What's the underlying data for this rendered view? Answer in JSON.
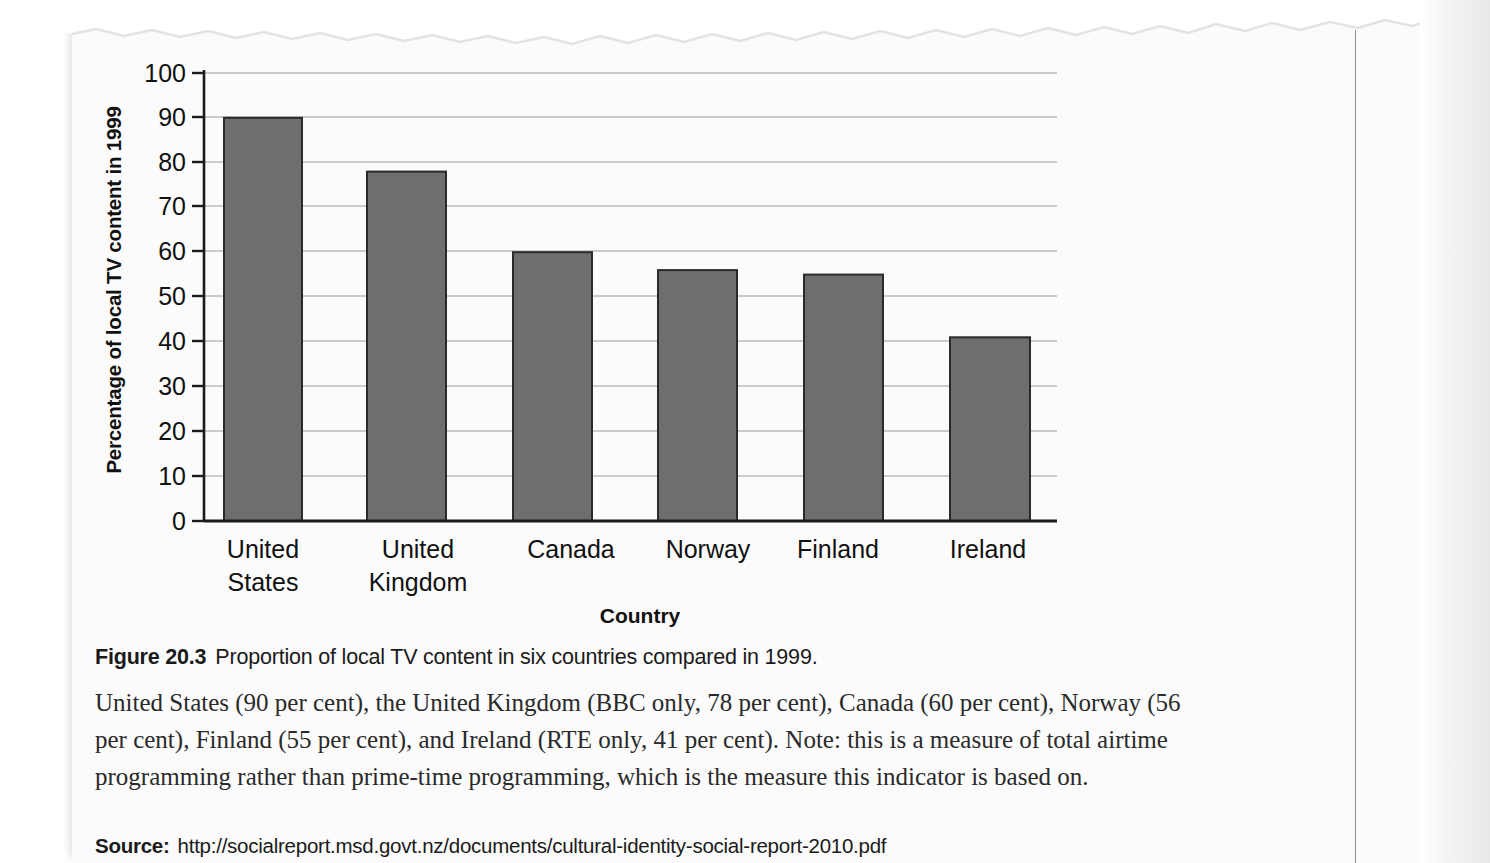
{
  "chart_data": {
    "type": "bar",
    "title": "",
    "xlabel": "Country",
    "ylabel": "Percentage of local TV content in 1999",
    "categories": [
      "United States",
      "United Kingdom",
      "Canada",
      "Norway",
      "Finland",
      "Ireland"
    ],
    "category_lines": [
      [
        "United",
        "States"
      ],
      [
        "United",
        "Kingdom"
      ],
      [
        "Canada"
      ],
      [
        "Norway"
      ],
      [
        "Finland"
      ],
      [
        "Ireland"
      ]
    ],
    "values": [
      90,
      78,
      60,
      56,
      55,
      41
    ],
    "ylim": [
      0,
      100
    ],
    "ytick_labels": [
      "0",
      "10",
      "20",
      "30",
      "40",
      "50",
      "60",
      "70",
      "80",
      "90",
      "100"
    ],
    "ytick_values": [
      0,
      10,
      20,
      30,
      40,
      50,
      60,
      70,
      80,
      90,
      100
    ],
    "grid": true,
    "legend": "none",
    "bar_fill": "#6e6e6e",
    "bar_stroke": "#2a2a2a",
    "grid_color": "#9a9a9a",
    "axis_color": "#1a1a1a"
  },
  "figure": {
    "number_label": "Figure 20.3",
    "caption": "Proportion of local TV content in six countries compared in 1999.",
    "body": "United States (90 per cent), the United Kingdom (BBC only, 78 per cent), Canada (60 per cent), Norway (56 per cent), Finland (55 per cent), and Ireland (RTE only, 41 per cent). Note: this is a measure of total airtime programming rather than prime-time programming, which is the measure this indicator is based on.",
    "source_label": "Source:",
    "source_url": "http://socialreport.msd.govt.nz/documents/cultural-identity-social-report-2010.pdf"
  }
}
